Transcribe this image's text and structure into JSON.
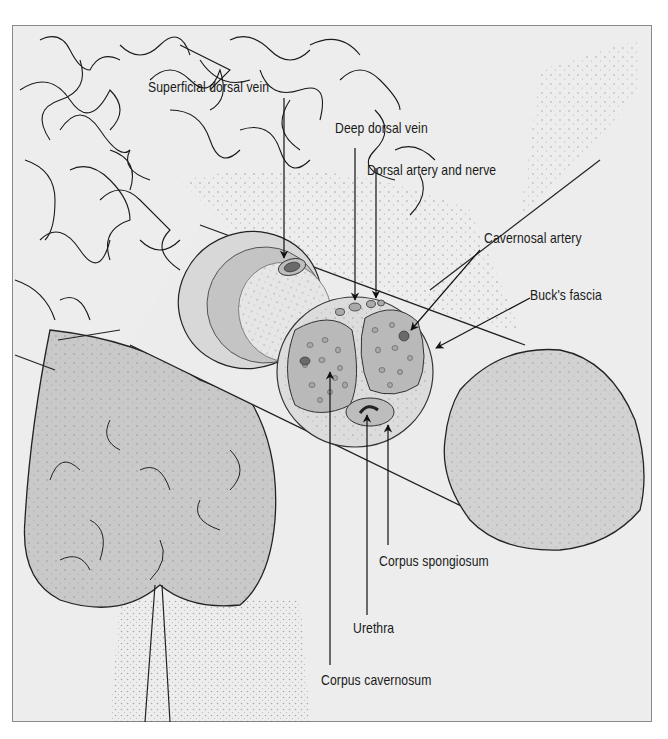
{
  "figure": {
    "colors": {
      "frame_bg": "#ededed",
      "frame_border": "#8a8a8a",
      "tissue_fill": "#c9c9c9",
      "tissue_light": "#dcdcdc",
      "line": "#1a1a1a"
    }
  },
  "labels": {
    "superficial_dorsal_vein": "Superficial dorsal vein",
    "deep_dorsal_vein": "Deep dorsal vein",
    "dorsal_artery_and_nerve": "Dorsal artery and nerve",
    "cavernosal_artery": "Cavernosal artery",
    "bucks_fascia": "Buck's fascia",
    "corpus_spongiosum": "Corpus spongiosum",
    "urethra": "Urethra",
    "corpus_cavernosum": "Corpus cavernosum"
  }
}
